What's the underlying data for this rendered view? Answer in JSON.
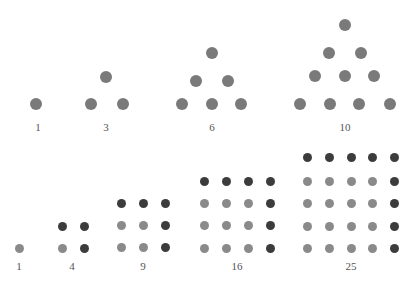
{
  "colors": {
    "triangle_dot": "#7a7a7a",
    "square_light": "#8a8a8a",
    "square_dark": "#3c3c3c",
    "label": "#555555"
  },
  "triangular_numbers": [
    {
      "label": "1",
      "label_pos": [
        38,
        121
      ],
      "r": 6,
      "dots": [
        [
          36,
          104
        ]
      ]
    },
    {
      "label": "3",
      "label_pos": [
        106,
        121
      ],
      "r": 6,
      "dots": [
        [
          106,
          77
        ],
        [
          91,
          104
        ],
        [
          123,
          104
        ]
      ]
    },
    {
      "label": "6",
      "label_pos": [
        212,
        121
      ],
      "r": 6,
      "dots": [
        [
          212,
          53
        ],
        [
          196,
          81
        ],
        [
          228,
          81
        ],
        [
          182,
          104
        ],
        [
          212,
          104
        ],
        [
          241,
          104
        ]
      ]
    },
    {
      "label": "10",
      "label_pos": [
        345,
        121
      ],
      "r": 6,
      "dots": [
        [
          345,
          25
        ],
        [
          329,
          53
        ],
        [
          361,
          53
        ],
        [
          315,
          76
        ],
        [
          345,
          76
        ],
        [
          374,
          76
        ],
        [
          300,
          104
        ],
        [
          330,
          104
        ],
        [
          359,
          104
        ],
        [
          390,
          104
        ]
      ]
    }
  ],
  "square_numbers": [
    {
      "label": "1",
      "label_pos": [
        19,
        260
      ],
      "n": 1,
      "cols": [
        19
      ],
      "rows": [
        248
      ]
    },
    {
      "label": "4",
      "label_pos": [
        72,
        260
      ],
      "n": 2,
      "cols": [
        62,
        84
      ],
      "rows": [
        226,
        248
      ]
    },
    {
      "label": "9",
      "label_pos": [
        143,
        260
      ],
      "n": 3,
      "cols": [
        121,
        143,
        165
      ],
      "rows": [
        203,
        225,
        247
      ]
    },
    {
      "label": "16",
      "label_pos": [
        237,
        260
      ],
      "n": 4,
      "cols": [
        204,
        226,
        248,
        270
      ],
      "rows": [
        181,
        203,
        225,
        248
      ]
    },
    {
      "label": "25",
      "label_pos": [
        351,
        260
      ],
      "n": 5,
      "cols": [
        307,
        329,
        351,
        372,
        394
      ],
      "rows": [
        157,
        181,
        203,
        226,
        248
      ]
    }
  ],
  "square_dot_radius": 4.5
}
